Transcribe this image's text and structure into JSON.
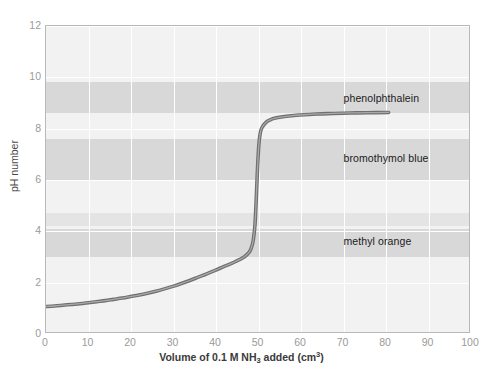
{
  "chart_data": {
    "type": "line",
    "title": "",
    "xlabel_parts": {
      "pre": "Volume of 0.1 M NH",
      "sub": "3",
      "mid": " added (cm",
      "sup": "3",
      "post": ")"
    },
    "xlabel_plain": "Volume of 0.1 M NH3 added (cm3)",
    "ylabel": "pH number",
    "xlim": [
      0,
      100
    ],
    "ylim": [
      0,
      12
    ],
    "xticks": [
      0,
      10,
      20,
      30,
      40,
      50,
      60,
      70,
      80,
      90,
      100
    ],
    "xtick_labels": [
      "0",
      "10",
      "20",
      "30",
      "40",
      "50",
      "60",
      "70",
      "80",
      "90",
      "100"
    ],
    "yticks": [
      0,
      2,
      4,
      6,
      8,
      10,
      12
    ],
    "ytick_labels": [
      "0",
      "2",
      "4",
      "6",
      "8",
      "10",
      "12"
    ],
    "grid": true,
    "legend_position": "inline-annotations",
    "series": [
      {
        "name": "titration curve",
        "color": "#7a7a7a",
        "points": [
          [
            0,
            1.0
          ],
          [
            2,
            1.02
          ],
          [
            4,
            1.05
          ],
          [
            6,
            1.08
          ],
          [
            8,
            1.11
          ],
          [
            10,
            1.15
          ],
          [
            12,
            1.19
          ],
          [
            14,
            1.23
          ],
          [
            16,
            1.28
          ],
          [
            18,
            1.33
          ],
          [
            20,
            1.39
          ],
          [
            22,
            1.45
          ],
          [
            24,
            1.52
          ],
          [
            26,
            1.6
          ],
          [
            28,
            1.69
          ],
          [
            30,
            1.79
          ],
          [
            32,
            1.9
          ],
          [
            34,
            2.02
          ],
          [
            36,
            2.15
          ],
          [
            38,
            2.28
          ],
          [
            40,
            2.42
          ],
          [
            42,
            2.56
          ],
          [
            44,
            2.7
          ],
          [
            45,
            2.78
          ],
          [
            46,
            2.86
          ],
          [
            47,
            2.96
          ],
          [
            48,
            3.12
          ],
          [
            48.5,
            3.28
          ],
          [
            49,
            3.6
          ],
          [
            49.4,
            4.2
          ],
          [
            49.7,
            5.2
          ],
          [
            50,
            6.4
          ],
          [
            50.3,
            7.3
          ],
          [
            50.6,
            7.75
          ],
          [
            51,
            8.0
          ],
          [
            52,
            8.22
          ],
          [
            53,
            8.32
          ],
          [
            54,
            8.38
          ],
          [
            56,
            8.44
          ],
          [
            58,
            8.48
          ],
          [
            60,
            8.51
          ],
          [
            64,
            8.55
          ],
          [
            68,
            8.57
          ],
          [
            72,
            8.59
          ],
          [
            76,
            8.6
          ],
          [
            81,
            8.61
          ]
        ]
      }
    ],
    "indicator_bands": [
      {
        "name": "phenolphthalein",
        "label": "phenolphthalein",
        "ph_low": 8.6,
        "ph_high": 9.8,
        "color": "#d8d8d8",
        "shade": "dark"
      },
      {
        "name": "bromothymol blue",
        "label": "bromothymol blue",
        "ph_low": 6.0,
        "ph_high": 7.6,
        "color": "#d8d8d8",
        "shade": "dark"
      },
      {
        "name": "methyl orange upper",
        "label": "",
        "ph_low": 4.2,
        "ph_high": 4.7,
        "color": "#e4e4e4",
        "shade": "light"
      },
      {
        "name": "methyl orange",
        "label": "methyl orange",
        "ph_low": 3.0,
        "ph_high": 4.1,
        "color": "#d8d8d8",
        "shade": "dark"
      }
    ],
    "annotations": [
      {
        "text": "phenolphthalein",
        "x": 70,
        "ph": 9.15
      },
      {
        "text": "bromothymol blue",
        "x": 70,
        "ph": 6.82
      },
      {
        "text": "methyl orange",
        "x": 70,
        "ph": 3.58
      }
    ]
  }
}
